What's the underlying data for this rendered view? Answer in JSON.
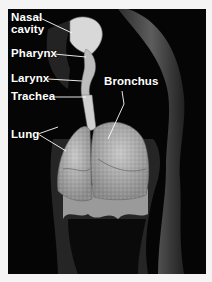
{
  "figure": {
    "labels": {
      "nasal_cavity_line1": "Nasal",
      "nasal_cavity_line2": "cavity",
      "pharynx": "Pharynx",
      "larynx": "Larynx",
      "trachea": "Trachea",
      "lung": "Lung",
      "bronchus": "Bronchus"
    },
    "colors": {
      "background": "#050505",
      "frame": "#f4f4f4",
      "label": "#ffffff"
    }
  }
}
